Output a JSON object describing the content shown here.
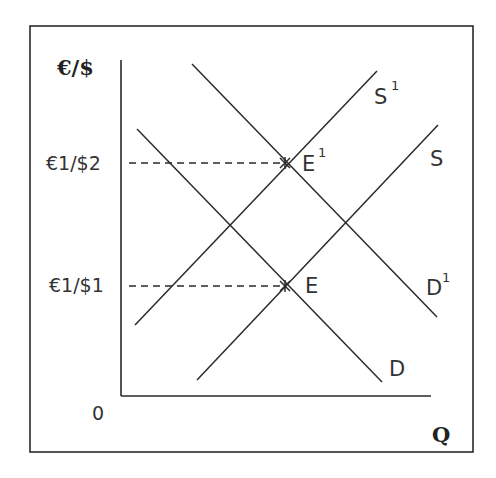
{
  "diagram": {
    "y_axis_label": "€/$",
    "x_axis_label": "Q",
    "origin_label": "0",
    "price_levels": [
      {
        "label": "€1/$2",
        "point": "E1"
      },
      {
        "label": "€1/$1",
        "point": "E"
      }
    ],
    "curves": [
      {
        "id": "D",
        "label": "D",
        "superscript": "",
        "kind": "demand"
      },
      {
        "id": "D1",
        "label": "D",
        "superscript": "1",
        "kind": "demand"
      },
      {
        "id": "S",
        "label": "S",
        "superscript": "",
        "kind": "supply"
      },
      {
        "id": "S1",
        "label": "S",
        "superscript": "1",
        "kind": "supply"
      }
    ],
    "equilibria": [
      {
        "id": "E",
        "label": "E",
        "superscript": "",
        "curves": [
          "D",
          "S1"
        ],
        "price": "€1/$1"
      },
      {
        "id": "E1",
        "label": "E",
        "superscript": "1",
        "curves": [
          "D1",
          "S1"
        ],
        "price": "€1/$2"
      }
    ]
  }
}
